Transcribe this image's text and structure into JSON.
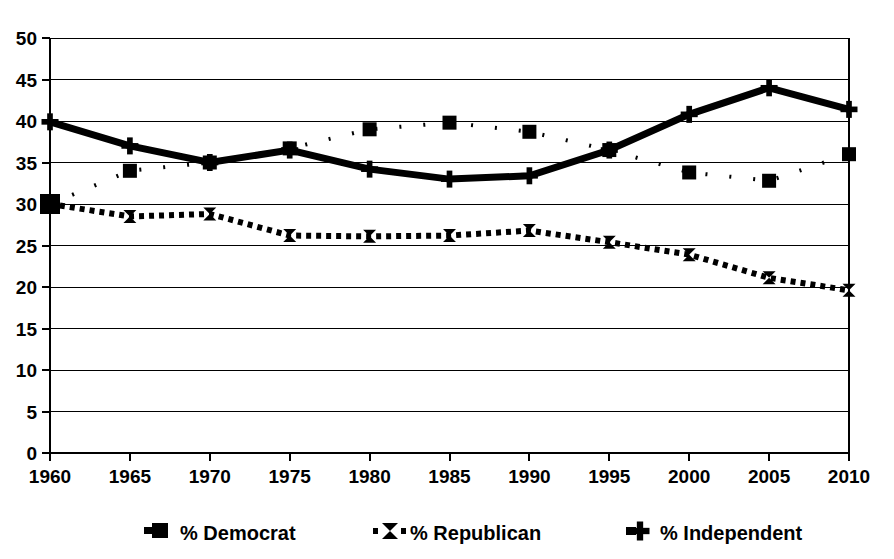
{
  "chart_data": {
    "type": "line",
    "title": "",
    "subtitle": "",
    "xlabel": "",
    "ylabel": "",
    "x": [
      1960,
      1965,
      1970,
      1975,
      1980,
      1985,
      1990,
      1995,
      2000,
      2005,
      2010
    ],
    "xtick_labels": [
      "1960",
      "1965",
      "1970",
      "1975",
      "1980",
      "1985",
      "1990",
      "1995",
      "2000",
      "2005",
      "2010"
    ],
    "ytick_labels": [
      "0",
      "5",
      "10",
      "15",
      "20",
      "25",
      "30",
      "35",
      "40",
      "45",
      "50"
    ],
    "yticks": [
      0,
      5,
      10,
      15,
      20,
      25,
      30,
      35,
      40,
      45,
      50
    ],
    "xlim": [
      1960,
      2010
    ],
    "ylim": [
      0,
      50
    ],
    "grid": "horizontal",
    "legend_position": "bottom",
    "series": [
      {
        "name": "% Democrat",
        "marker": "square",
        "line_style": "fine-dotted",
        "color": "#000000",
        "values": [
          30.0,
          34.0,
          35.0,
          36.7,
          39.0,
          39.8,
          38.7,
          36.5,
          33.8,
          32.8,
          36.0
        ]
      },
      {
        "name": "% Republican",
        "marker": "hourglass",
        "line_style": "thick-dotted",
        "color": "#000000",
        "values": [
          30.0,
          28.5,
          28.8,
          26.2,
          26.1,
          26.2,
          26.8,
          25.4,
          23.9,
          21.1,
          19.6
        ]
      },
      {
        "name": "% Independent",
        "marker": "cross",
        "line_style": "solid-thick",
        "color": "#000000",
        "values": [
          39.9,
          37.0,
          35.0,
          36.5,
          34.2,
          33.0,
          33.4,
          36.5,
          40.8,
          44.0,
          41.4
        ]
      }
    ]
  },
  "legend": {
    "items": [
      {
        "label": "% Democrat",
        "marker": "square-marker"
      },
      {
        "label": "% Republican",
        "marker": "hourglass-marker"
      },
      {
        "label": "% Independent",
        "marker": "cross-marker"
      }
    ]
  }
}
